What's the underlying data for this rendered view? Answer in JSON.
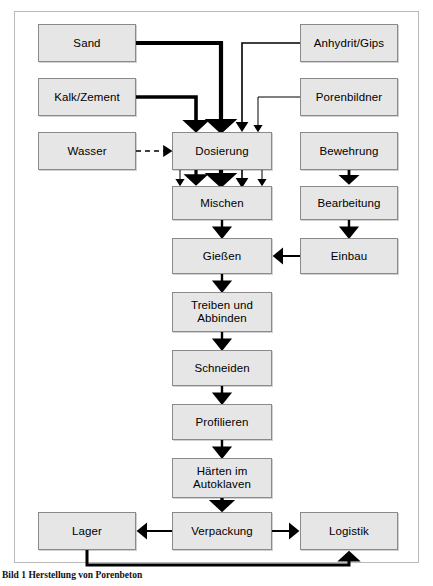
{
  "figure": {
    "caption": "Bild 1  Herstellung von Porenbeton",
    "frame_border_color": "#b9b9b9",
    "node_fill_color": "#e6e6e6",
    "node_border_color": "#8a8a8a",
    "connector_color": "#000000"
  },
  "diagram": {
    "type": "flowchart",
    "title": "Herstellung von Porenbeton",
    "nodes": [
      {
        "id": "sand",
        "label": "Sand",
        "x": 38,
        "y": 24,
        "w": 98,
        "h": 38,
        "column": "left"
      },
      {
        "id": "kalk",
        "label": "Kalk/Zement",
        "x": 38,
        "y": 78,
        "w": 98,
        "h": 38,
        "column": "left"
      },
      {
        "id": "wasser",
        "label": "Wasser",
        "x": 38,
        "y": 132,
        "w": 98,
        "h": 38,
        "column": "left"
      },
      {
        "id": "anhydrit",
        "label": "Anhydrit/Gips",
        "x": 300,
        "y": 24,
        "w": 98,
        "h": 38,
        "column": "right"
      },
      {
        "id": "porenbildner",
        "label": "Porenbildner",
        "x": 300,
        "y": 78,
        "w": 98,
        "h": 38,
        "column": "right"
      },
      {
        "id": "bewehrung",
        "label": "Bewehrung",
        "x": 300,
        "y": 132,
        "w": 98,
        "h": 38,
        "column": "right"
      },
      {
        "id": "bearbeitung",
        "label": "Bearbeitung",
        "x": 300,
        "y": 186,
        "w": 98,
        "h": 34,
        "column": "right"
      },
      {
        "id": "einbau",
        "label": "Einbau",
        "x": 300,
        "y": 238,
        "w": 98,
        "h": 36,
        "column": "right"
      },
      {
        "id": "dosierung",
        "label": "Dosierung",
        "x": 172,
        "y": 132,
        "w": 100,
        "h": 38,
        "column": "center"
      },
      {
        "id": "mischen",
        "label": "Mischen",
        "x": 172,
        "y": 186,
        "w": 100,
        "h": 34,
        "column": "center"
      },
      {
        "id": "giessen",
        "label": "Gießen",
        "x": 172,
        "y": 238,
        "w": 100,
        "h": 36,
        "column": "center"
      },
      {
        "id": "treiben",
        "label": "Treiben und\nAbbinden",
        "x": 172,
        "y": 292,
        "w": 100,
        "h": 40,
        "column": "center"
      },
      {
        "id": "schneiden",
        "label": "Schneiden",
        "x": 172,
        "y": 350,
        "w": 100,
        "h": 36,
        "column": "center"
      },
      {
        "id": "profilieren",
        "label": "Profilieren",
        "x": 172,
        "y": 404,
        "w": 100,
        "h": 36,
        "column": "center"
      },
      {
        "id": "haerten",
        "label": "Härten im\nAutoklaven",
        "x": 172,
        "y": 458,
        "w": 100,
        "h": 40,
        "column": "center"
      },
      {
        "id": "verpackung",
        "label": "Verpackung",
        "x": 172,
        "y": 512,
        "w": 100,
        "h": 38,
        "column": "center"
      },
      {
        "id": "lager",
        "label": "Lager",
        "x": 38,
        "y": 512,
        "w": 98,
        "h": 38,
        "column": "left"
      },
      {
        "id": "logistik",
        "label": "Logistik",
        "x": 300,
        "y": 512,
        "w": 98,
        "h": 38,
        "column": "right"
      }
    ],
    "edges": [
      {
        "from": "sand",
        "to": "dosierung",
        "style": "solid",
        "weight": "heavy"
      },
      {
        "from": "kalk",
        "to": "dosierung",
        "style": "solid",
        "weight": "heavy"
      },
      {
        "from": "wasser",
        "to": "dosierung",
        "style": "dashed",
        "weight": "light"
      },
      {
        "from": "anhydrit",
        "to": "dosierung",
        "style": "solid",
        "weight": "medium"
      },
      {
        "from": "porenbildner",
        "to": "dosierung",
        "style": "solid",
        "weight": "light"
      },
      {
        "from": "dosierung",
        "to": "mischen",
        "style": "solid",
        "weight": "mixed-5"
      },
      {
        "from": "mischen",
        "to": "giessen",
        "style": "solid",
        "weight": "medium"
      },
      {
        "from": "giessen",
        "to": "treiben",
        "style": "solid",
        "weight": "medium"
      },
      {
        "from": "treiben",
        "to": "schneiden",
        "style": "solid",
        "weight": "medium"
      },
      {
        "from": "schneiden",
        "to": "profilieren",
        "style": "solid",
        "weight": "medium"
      },
      {
        "from": "profilieren",
        "to": "haerten",
        "style": "solid",
        "weight": "medium"
      },
      {
        "from": "haerten",
        "to": "verpackung",
        "style": "solid",
        "weight": "heavy"
      },
      {
        "from": "bewehrung",
        "to": "bearbeitung",
        "style": "solid",
        "weight": "medium"
      },
      {
        "from": "bearbeitung",
        "to": "einbau",
        "style": "solid",
        "weight": "medium"
      },
      {
        "from": "einbau",
        "to": "giessen",
        "style": "solid",
        "weight": "medium"
      },
      {
        "from": "verpackung",
        "to": "lager",
        "style": "solid",
        "weight": "medium"
      },
      {
        "from": "verpackung",
        "to": "logistik",
        "style": "solid",
        "weight": "medium"
      },
      {
        "from": "lager",
        "to": "logistik",
        "style": "solid",
        "weight": "heavy"
      }
    ]
  }
}
